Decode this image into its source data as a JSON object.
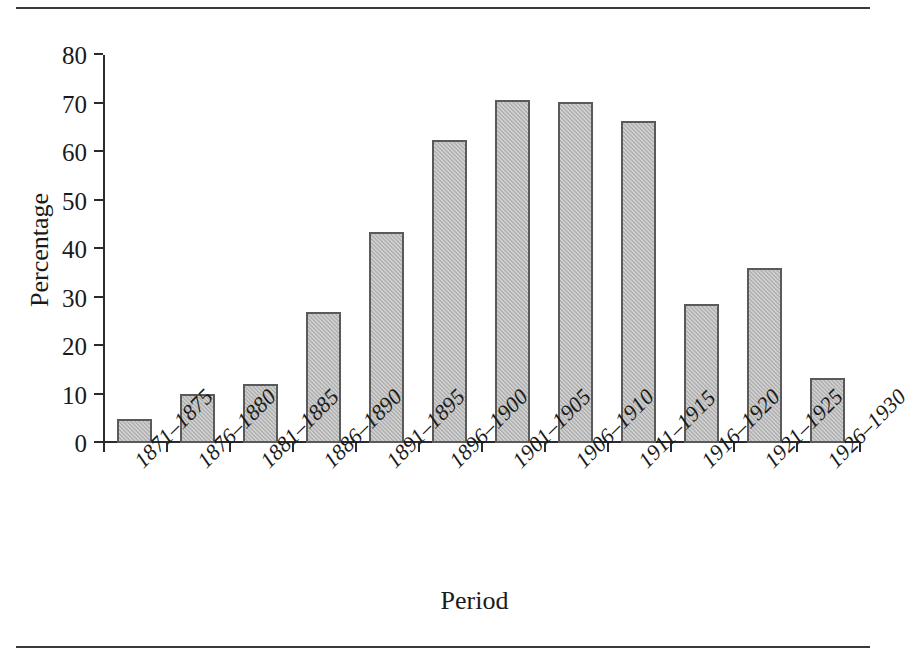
{
  "figure": {
    "has_top_rule": true,
    "has_bottom_rule": true,
    "background": "#ffffff",
    "bar_fill": "#b3b3b3",
    "bar_stroke": "#5a5a5a",
    "axis_color": "#2b2b2b"
  },
  "chart_data": {
    "type": "bar",
    "title": "",
    "subtitle": "",
    "xlabel": "Period",
    "ylabel": "Percentage",
    "categories": [
      "1871–1875",
      "1876–1880",
      "1881–1885",
      "1886–1890",
      "1891–1895",
      "1896–1900",
      "1901–1905",
      "1906–1910",
      "1911–1915",
      "1916–1920",
      "1921–1925",
      "1926–1930"
    ],
    "values": [
      4.9,
      10.2,
      12.1,
      27.0,
      43.6,
      62.4,
      70.7,
      70.4,
      66.4,
      28.6,
      36.1,
      13.5
    ],
    "ylim": [
      0,
      80
    ],
    "yticks": [
      0,
      10,
      20,
      30,
      40,
      50,
      60,
      70,
      80
    ],
    "ytick_labels": [
      "0",
      "10",
      "20",
      "30",
      "40",
      "50",
      "60",
      "70",
      "80"
    ],
    "grid": false,
    "legend": null,
    "legend_position": "none",
    "xtick_label_rotation": 45,
    "annotations": []
  }
}
